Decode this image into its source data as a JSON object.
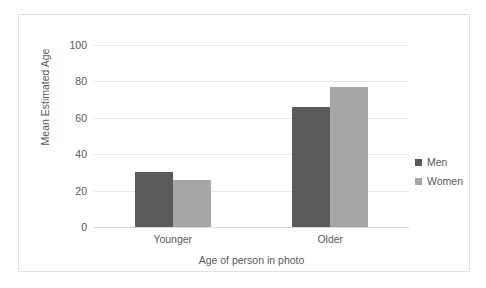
{
  "chart_data": {
    "type": "bar",
    "title": "",
    "categories": [
      "Younger",
      "Older"
    ],
    "series": [
      {
        "name": "Men",
        "values": [
          30,
          66
        ],
        "color": "#595959"
      },
      {
        "name": "Women",
        "values": [
          26,
          77
        ],
        "color": "#a6a6a6"
      }
    ],
    "xlabel": "Age of person in photo",
    "ylabel": "Mean Estimated Age",
    "ylim": [
      0,
      100
    ],
    "yticks": [
      0,
      20,
      40,
      60,
      80,
      100
    ],
    "ytick_labels": [
      "0",
      "20",
      "40",
      "60",
      "80",
      "100"
    ],
    "grid": true,
    "legend_position": "right",
    "legend_entries": [
      "Men",
      "Women"
    ],
    "border": true,
    "background_color": "#ffffff",
    "gridline_color": "#e8e8e8"
  }
}
